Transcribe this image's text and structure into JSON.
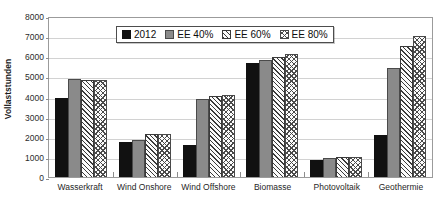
{
  "chart_data": {
    "type": "bar",
    "title": "",
    "subtitle": "",
    "xlabel": "",
    "ylabel": "Vollaststunden",
    "ylim": [
      0,
      8000
    ],
    "ytick_step": 1000,
    "yticks": [
      "8000",
      "7000",
      "6000",
      "5000",
      "4000",
      "3000",
      "2000",
      "1000",
      "0"
    ],
    "grid": true,
    "legend_position": "top-center-inside",
    "categories": [
      "Wasserkraft",
      "Wind Onshore",
      "Wind Offshore",
      "Biomasse",
      "Photovoltaik",
      "Geothermie"
    ],
    "series": [
      {
        "name": "2012",
        "values": [
          3950,
          1750,
          1600,
          5650,
          850,
          2100
        ]
      },
      {
        "name": "EE 40%",
        "values": [
          4850,
          1850,
          3900,
          5800,
          950,
          5400
        ]
      },
      {
        "name": "EE 60%",
        "values": [
          4800,
          2150,
          4050,
          5950,
          1000,
          6500
        ]
      },
      {
        "name": "EE 80%",
        "values": [
          4800,
          2150,
          4100,
          6100,
          1000,
          7000
        ]
      }
    ]
  },
  "legend": {
    "items": [
      {
        "label": "2012",
        "swatch": "solid-black-square-icon"
      },
      {
        "label": "EE 40%",
        "swatch": "solid-gray-square-icon"
      },
      {
        "label": "EE 60%",
        "swatch": "diagonal-hatch-square-icon"
      },
      {
        "label": "EE 80%",
        "swatch": "cross-hatch-square-icon"
      }
    ]
  },
  "colors": {
    "series_2012": "#111111",
    "series_ee40": "#8a8a8a",
    "series_ee60": "#3a3a3a",
    "series_ee80": "#4a4a4a",
    "gridline": "#d2d2d2",
    "axis": "#9b9b9b",
    "background": "#ffffff"
  }
}
